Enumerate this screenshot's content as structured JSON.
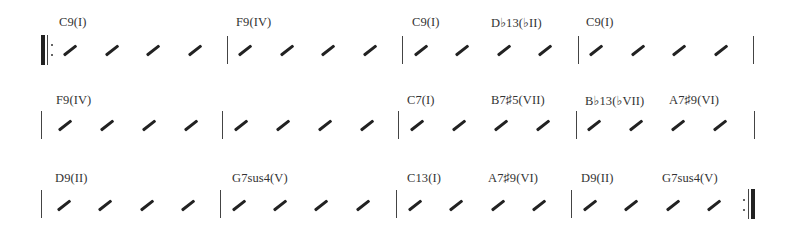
{
  "chart_sheet": {
    "rows": [
      {
        "bars": [
          {
            "chords": [
              {
                "label": "C9(I)",
                "x": 59
              }
            ]
          },
          {
            "chords": [
              {
                "label": "F9(IV)",
                "x": 236
              }
            ]
          },
          {
            "chords": [
              {
                "label": "C9(I)",
                "x": 412
              },
              {
                "label": "D♭13(♭II)",
                "x": 491
              }
            ]
          },
          {
            "chords": [
              {
                "label": "C9(I)",
                "x": 586
              }
            ]
          }
        ]
      },
      {
        "bars": [
          {
            "chords": [
              {
                "label": "F9(IV)",
                "x": 56
              }
            ]
          },
          {
            "chords": []
          },
          {
            "chords": [
              {
                "label": "C7(I)",
                "x": 407
              },
              {
                "label": "B7♯5(VII)",
                "x": 491
              }
            ]
          },
          {
            "chords": [
              {
                "label": "B♭13(♭VII)",
                "x": 585
              },
              {
                "label": "A7♯9(VI)",
                "x": 669
              }
            ]
          }
        ]
      },
      {
        "bars": [
          {
            "chords": [
              {
                "label": "D9(II)",
                "x": 55
              }
            ]
          },
          {
            "chords": [
              {
                "label": "G7sus4(V)",
                "x": 232
              }
            ]
          },
          {
            "chords": [
              {
                "label": "C13(I)",
                "x": 407
              },
              {
                "label": "A7♯9(VI)",
                "x": 488
              }
            ]
          },
          {
            "chords": [
              {
                "label": "D9(II)",
                "x": 581
              },
              {
                "label": "G7sus4(V)",
                "x": 662
              }
            ]
          }
        ]
      }
    ],
    "beats_per_bar": 4,
    "start_repeat": true,
    "end_repeat": true
  }
}
